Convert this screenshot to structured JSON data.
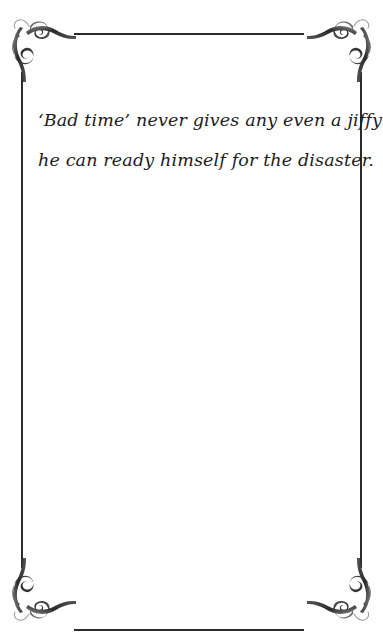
{
  "page": {
    "background_color": "#ffffff",
    "ink_color": "#1c1c1c",
    "frame_color": "#2b2b2b",
    "width": 383,
    "height": 632
  },
  "frame": {
    "rules": [
      {
        "name": "top-rule"
      },
      {
        "name": "bottom-rule"
      },
      {
        "name": "left-rule"
      },
      {
        "name": "right-rule"
      }
    ],
    "ornaments": [
      {
        "name": "top-left-flourish-icon"
      },
      {
        "name": "top-right-flourish-icon"
      },
      {
        "name": "bottom-left-flourish-icon"
      },
      {
        "name": "bottom-right-flourish-icon"
      }
    ]
  },
  "quote": {
    "lines": [
      "‘Bad time’ never gives any even a jiffy where in",
      "he can ready himself for the disaster."
    ],
    "full_text": "‘Bad time’ never gives any even a jiffy where in he can ready himself for the disaster."
  }
}
